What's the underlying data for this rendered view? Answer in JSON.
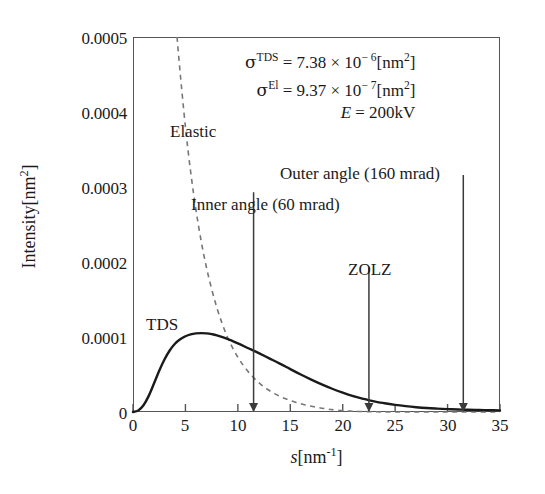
{
  "figure": {
    "background": "#ffffff",
    "frame_color": "#555555",
    "curve_color": "#1a1a1a"
  },
  "axes": {
    "x": {
      "title_var": "s",
      "title_unit": "[nm",
      "title_exp": "-1",
      "title_unit_close": "]",
      "ticks": [
        "0",
        "5",
        "10",
        "15",
        "20",
        "25",
        "30",
        "35"
      ],
      "min": 0,
      "max": 35,
      "step": 5
    },
    "y": {
      "title_text": "Intensity",
      "title_unit": "[nm",
      "title_exp": "2",
      "title_unit_close": "]",
      "ticks": [
        "0",
        "0.0001",
        "0.0002",
        "0.0003",
        "0.0004",
        "0.0005"
      ],
      "min": 0,
      "max": 0.0005,
      "step": 0.0001
    }
  },
  "parameters": {
    "tds_sigma_symbol": "σ",
    "tds_sigma_sup": "TDS",
    "tds_sigma_value": " = 7.38 × 10",
    "tds_sigma_exp": "− 6",
    "tds_sigma_unit": "[nm",
    "tds_sigma_unit_exp": "2",
    "tds_sigma_unit_close": "]",
    "el_sigma_symbol": "σ",
    "el_sigma_sup": "El",
    "el_sigma_value": " = 9.37 × 10",
    "el_sigma_exp": "− 7",
    "el_sigma_unit": "[nm",
    "el_sigma_unit_exp": "2",
    "el_sigma_unit_close": "]",
    "energy_symbol": "E",
    "energy_value": " = 200kV"
  },
  "curve_labels": {
    "elastic": "Elastic",
    "tds": "TDS"
  },
  "annotations": {
    "inner_angle": "Inner angle (60 mrad)",
    "outer_angle": "Outer angle (160 mrad)",
    "zolz": "ZOLZ"
  },
  "chart_data": {
    "type": "line",
    "title": "",
    "xlabel": "s [nm^-1]",
    "ylabel": "Intensity [nm^2]",
    "xlim": [
      0,
      35
    ],
    "ylim": [
      0,
      0.0005
    ],
    "xticks": [
      0,
      5,
      10,
      15,
      20,
      25,
      30,
      35
    ],
    "yticks": [
      0,
      0.0001,
      0.0002,
      0.0003,
      0.0004,
      0.0005
    ],
    "grid": false,
    "legend": "inline-labels",
    "series": [
      {
        "name": "TDS",
        "style": "solid",
        "color": "#1a1a1a",
        "x": [
          0,
          0.5,
          1,
          1.5,
          2,
          2.5,
          3,
          3.5,
          4,
          4.5,
          5,
          5.5,
          6,
          6.5,
          7,
          7.5,
          8,
          9,
          10,
          11,
          11.5,
          12,
          13,
          14,
          15,
          16,
          17,
          18,
          19,
          20,
          21,
          22,
          22.5,
          23,
          24,
          25,
          26,
          27,
          28,
          29,
          30,
          31,
          31.5,
          32,
          33,
          34,
          35
        ],
        "y": [
          0.0,
          2e-06,
          9e-06,
          2.15e-05,
          3.8e-05,
          5.5e-05,
          7e-05,
          8.2e-05,
          9.1e-05,
          9.7e-05,
          0.000101,
          0.0001035,
          0.0001048,
          0.0001052,
          0.0001048,
          0.0001038,
          0.0001022,
          9.75e-05,
          9.15e-05,
          8.5e-05,
          8.18e-05,
          7.85e-05,
          7.15e-05,
          6.45e-05,
          5.72e-05,
          5e-05,
          4.32e-05,
          3.68e-05,
          3.1e-05,
          2.58e-05,
          2.12e-05,
          1.74e-05,
          1.57e-05,
          1.42e-05,
          1.16e-05,
          9.5e-06,
          7.8e-06,
          6.4e-06,
          5.3e-06,
          4.5e-06,
          3.8e-06,
          3.3e-06,
          3.1e-06,
          2.9e-06,
          2.6e-06,
          2.4e-06,
          2.2e-06
        ]
      },
      {
        "name": "Elastic",
        "style": "dashed",
        "color": "#777777",
        "x": [
          4.2,
          4.5,
          5,
          5.5,
          6,
          6.5,
          7,
          7.5,
          8,
          8.5,
          9,
          9.5,
          10,
          10.5,
          11,
          11.5,
          12,
          12.5,
          13,
          13.5,
          14,
          14.5,
          15,
          15.5,
          16,
          16.5,
          17,
          17.5,
          18,
          18.5,
          19,
          20,
          21,
          22,
          23,
          25,
          28,
          31,
          35
        ],
        "y": [
          0.0005,
          0.000452,
          0.00038,
          0.00032,
          0.00027,
          0.000228,
          0.000193,
          0.000164,
          0.000139,
          0.000118,
          0.0001,
          8.55e-05,
          7.3e-05,
          6.25e-05,
          5.35e-05,
          4.58e-05,
          3.92e-05,
          3.35e-05,
          2.87e-05,
          2.45e-05,
          2.1e-05,
          1.79e-05,
          1.52e-05,
          1.29e-05,
          1.09e-05,
          9.2e-06,
          7.6e-06,
          6.3e-06,
          5.1e-06,
          4.1e-06,
          3.2e-06,
          1.8e-06,
          1e-06,
          6e-07,
          3e-07,
          1e-07,
          0.0,
          0.0,
          0.0
        ]
      }
    ],
    "vertical_markers": [
      {
        "label": "Inner angle (60 mrad)",
        "x": 11.5,
        "top_y": 0.000293,
        "bottom_y": 0.0
      },
      {
        "label": "ZOLZ",
        "x": 22.5,
        "top_y": 0.000193,
        "bottom_y": 0.0
      },
      {
        "label": "Outer angle (160 mrad)",
        "x": 31.5,
        "top_y": 0.000316,
        "bottom_y": 0.0
      }
    ],
    "annotations_text": [
      "σTDS = 7.38 × 10^-6 [nm^2]",
      "σEl = 9.37 × 10^-7 [nm^2]",
      "E = 200kV"
    ]
  }
}
